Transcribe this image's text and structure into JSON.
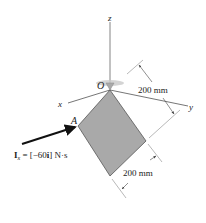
{
  "diagram": {
    "axes": {
      "z_label": "z",
      "x_label": "x",
      "y_label": "y",
      "origin_label": "O"
    },
    "point_label": "A",
    "impulse": {
      "symbol": "I",
      "subscript": "x",
      "expression": " = [−60",
      "unit_vector": "i",
      "unit": "] N·s"
    },
    "dimensions": [
      {
        "label": "200 mm"
      },
      {
        "label": "200 mm"
      }
    ],
    "colors": {
      "plate_fill": "#a9a9a9",
      "plate_edge": "#555555",
      "axis": "#555555",
      "arrow": "#111111",
      "support": "#b8b8b8"
    }
  }
}
